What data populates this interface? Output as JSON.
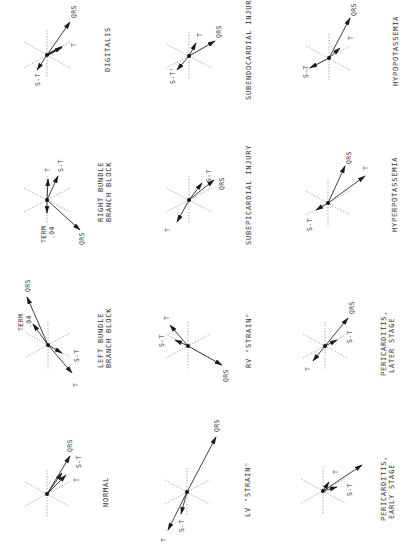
{
  "figure": {
    "orientation": "rotated-90-ccw",
    "panels": [
      {
        "id": "digitalis",
        "title": [
          "DIGITALIS"
        ],
        "origin": [
          47,
          55
        ],
        "title_pos": [
          108,
          55
        ],
        "vectors": [
          {
            "label": "QRS",
            "to": [
              70,
              22
            ],
            "label_pos": [
              77,
              14
            ]
          },
          {
            "label": "T",
            "to": [
              62,
              47
            ],
            "label_pos": [
              74,
              45
            ]
          },
          {
            "label": "S-T",
            "to": [
              37,
              70
            ],
            "label_pos": [
              37,
              84
            ]
          }
        ]
      },
      {
        "id": "subendocardial-injury",
        "title": [
          "SUBENDOCARDIAL INJURY"
        ],
        "origin": [
          189,
          56
        ],
        "title_pos": [
          250,
          52
        ],
        "vectors": [
          {
            "label": "QRS",
            "to": [
              215,
              41
            ],
            "label_pos": [
              220,
              31
            ]
          },
          {
            "label": "T",
            "to": [
              196,
              43
            ],
            "label_pos": [
              200,
              35
            ]
          },
          {
            "label": "S-T'",
            "to": [
              177,
              70
            ],
            "label_pos": [
              172,
              82
            ]
          }
        ]
      },
      {
        "id": "hypopotassemia",
        "title": [
          "HYPOPOTASSEMIA"
        ],
        "origin": [
          329,
          58
        ],
        "title_pos": [
          395,
          52
        ],
        "vectors": [
          {
            "label": "QRS",
            "to": [
              350,
              18
            ],
            "label_pos": [
              355,
              10
            ]
          },
          {
            "label": "T",
            "to": [
              340,
              48
            ],
            "label_pos": [
              350,
              38
            ]
          },
          {
            "label": "S-T",
            "to": [
              310,
              68
            ],
            "label_pos": [
              305,
              75
            ]
          }
        ]
      },
      {
        "id": "right-bundle-branch-block",
        "title": [
          "RIGHT BUNDLE",
          "BRANCH BLOCK"
        ],
        "origin": [
          47,
          200
        ],
        "title_pos": [
          102,
          192
        ],
        "vectors": [
          {
            "label": "T",
            "to": [
              48,
              179
            ],
            "label_pos": [
              50,
              168
            ]
          },
          {
            "label": "S-T",
            "to": [
              58,
              176
            ],
            "label_pos": [
              60,
              164
            ]
          },
          {
            "label": "QRS",
            "to": [
              80,
              230
            ],
            "label_pos": [
              80,
              243
            ]
          },
          {
            "label": "TERM .04",
            "to": [
              47,
              213
            ],
            "label_pos": [
              44,
              236
            ]
          }
        ]
      },
      {
        "id": "subepicardial-injury",
        "title": [
          "SUBEPICARDIAL INJURY"
        ],
        "origin": [
          189,
          200
        ],
        "title_pos": [
          250,
          200
        ],
        "vectors": [
          {
            "label": "S-T",
            "to": [
              202,
              183
            ],
            "label_pos": [
              209,
              178
            ]
          },
          {
            "label": "QRS",
            "to": [
              214,
              180
            ],
            "label_pos": [
              221,
              186
            ]
          },
          {
            "label": "T",
            "to": [
              177,
              222
            ],
            "label_pos": [
              168,
              230
            ]
          }
        ]
      },
      {
        "id": "hyperpotassemia",
        "title": [
          "HYPERPOTASSEMIA"
        ],
        "origin": [
          328,
          203
        ],
        "title_pos": [
          395,
          198
        ],
        "vectors": [
          {
            "label": "QRS",
            "to": [
              345,
              166
            ],
            "label_pos": [
              350,
              156
            ]
          },
          {
            "label": "T",
            "to": [
              365,
              176
            ],
            "label_pos": [
              366,
              166
            ]
          },
          {
            "label": "S-T",
            "to": [
              316,
              210
            ],
            "label_pos": [
              309,
              225
            ]
          }
        ]
      },
      {
        "id": "left-bundle-branch-block",
        "title": [
          "LEFT BUNDLE",
          "BRANCH BLOCK"
        ],
        "origin": [
          48,
          345
        ],
        "title_pos": [
          102,
          338
        ],
        "vectors": [
          {
            "label": "QRS",
            "to": [
              27,
              297
            ],
            "label_pos": [
              28,
              285
            ]
          },
          {
            "label": "TERM .04",
            "to": [
              33,
              324
            ],
            "label_pos": [
              24,
              328
            ]
          },
          {
            "label": "S-T",
            "to": [
              62,
              353
            ],
            "label_pos": [
              77,
              357
            ]
          },
          {
            "label": "T",
            "to": [
              72,
              373
            ],
            "label_pos": [
              76,
              385
            ]
          }
        ]
      },
      {
        "id": "rv-strain",
        "title": [
          "RV \"STRAIN\""
        ],
        "origin": [
          188,
          346
        ],
        "title_pos": [
          250,
          338
        ],
        "vectors": [
          {
            "label": "T",
            "to": [
              170,
              325
            ],
            "label_pos": [
              167,
              318
            ]
          },
          {
            "label": "S-T",
            "to": [
              175,
              340
            ],
            "label_pos": [
              162,
              341
            ]
          },
          {
            "label": "QRS",
            "to": [
              222,
              365
            ],
            "label_pos": [
              226,
              378
            ]
          }
        ]
      },
      {
        "id": "pericarditis-later-stage",
        "title": [
          "PERICARDITIS,",
          "LATER STAGE"
        ],
        "origin": [
          325,
          346
        ],
        "title_pos": [
          390,
          342
        ],
        "vectors": [
          {
            "label": "QRS",
            "to": [
              348,
              318
            ],
            "label_pos": [
              352,
              307
            ]
          },
          {
            "label": "S-T",
            "to": [
              337,
              340
            ],
            "label_pos": [
              349,
              342
            ]
          },
          {
            "label": "T",
            "to": [
              313,
              361
            ],
            "label_pos": [
              308,
              368
            ]
          }
        ]
      },
      {
        "id": "normal",
        "title": [
          "NORMAL"
        ],
        "origin": [
          47,
          494
        ],
        "title_pos": [
          108,
          494
        ],
        "vectors": [
          {
            "label": "QRS",
            "to": [
              70,
              456
            ],
            "label_pos": [
              73,
              446
            ]
          },
          {
            "label": "S-T",
            "to": [
              62,
              473
            ],
            "label_pos": [
              80,
              463
            ]
          },
          {
            "label": "T",
            "to": [
              66,
              475
            ],
            "label_pos": [
              73,
              478
            ]
          }
        ]
      },
      {
        "id": "lv-strain",
        "title": [
          "LV \"STRAIN\""
        ],
        "origin": [
          187,
          492
        ],
        "title_pos": [
          250,
          494
        ],
        "vectors": [
          {
            "label": "QRS",
            "to": [
              216,
              437
            ],
            "label_pos": [
              218,
              424
            ]
          },
          {
            "label": "S-T",
            "to": [
              181,
              514
            ],
            "label_pos": [
              182,
              528
            ]
          },
          {
            "label": "T",
            "to": [
              168,
              530
            ],
            "label_pos": [
              163,
              540
            ]
          }
        ]
      },
      {
        "id": "pericarditis-early-stage",
        "title": [
          "PERICARDITIS,",
          "EARLY STAGE"
        ],
        "origin": [
          323,
          491
        ],
        "title_pos": [
          390,
          489
        ],
        "vectors": [
          {
            "label": "T",
            "to": [
              362,
              465
            ],
            "label_pos": [
              337,
              472
            ]
          },
          {
            "label": "S-T",
            "to": [
              337,
              487
            ],
            "label_pos": [
              350,
              493
            ]
          },
          {
            "label": "T-short",
            "to": [
              329,
              482
            ],
            "label_pos": null
          }
        ]
      }
    ]
  },
  "labels": {
    "digitalis": "DIGITALIS",
    "subendocardial": "SUBENDOCARDIAL INJURY",
    "hypopotassemia": "HYPOPOTASSEMIA",
    "rbbb_1": "RIGHT BUNDLE",
    "rbbb_2": "BRANCH BLOCK",
    "subepicardial": "SUBEPICARDIAL INJURY",
    "hyperpotassemia": "HYPERPOTASSEMIA",
    "lbbb_1": "LEFT BUNDLE",
    "lbbb_2": "BRANCH BLOCK",
    "rv_strain": "RV \"STRAIN\"",
    "peri_later_1": "PERICARDITIS,",
    "peri_later_2": "LATER STAGE",
    "normal": "NORMAL",
    "lv_strain": "LV \"STRAIN\"",
    "peri_early_1": "PERICARDITIS,",
    "peri_early_2": "EARLY STAGE",
    "qrs": "QRS",
    "t": "T",
    "st": "S-T",
    "st_prime": "S-T'",
    "term": "TERM",
    "term_val": ".04"
  }
}
